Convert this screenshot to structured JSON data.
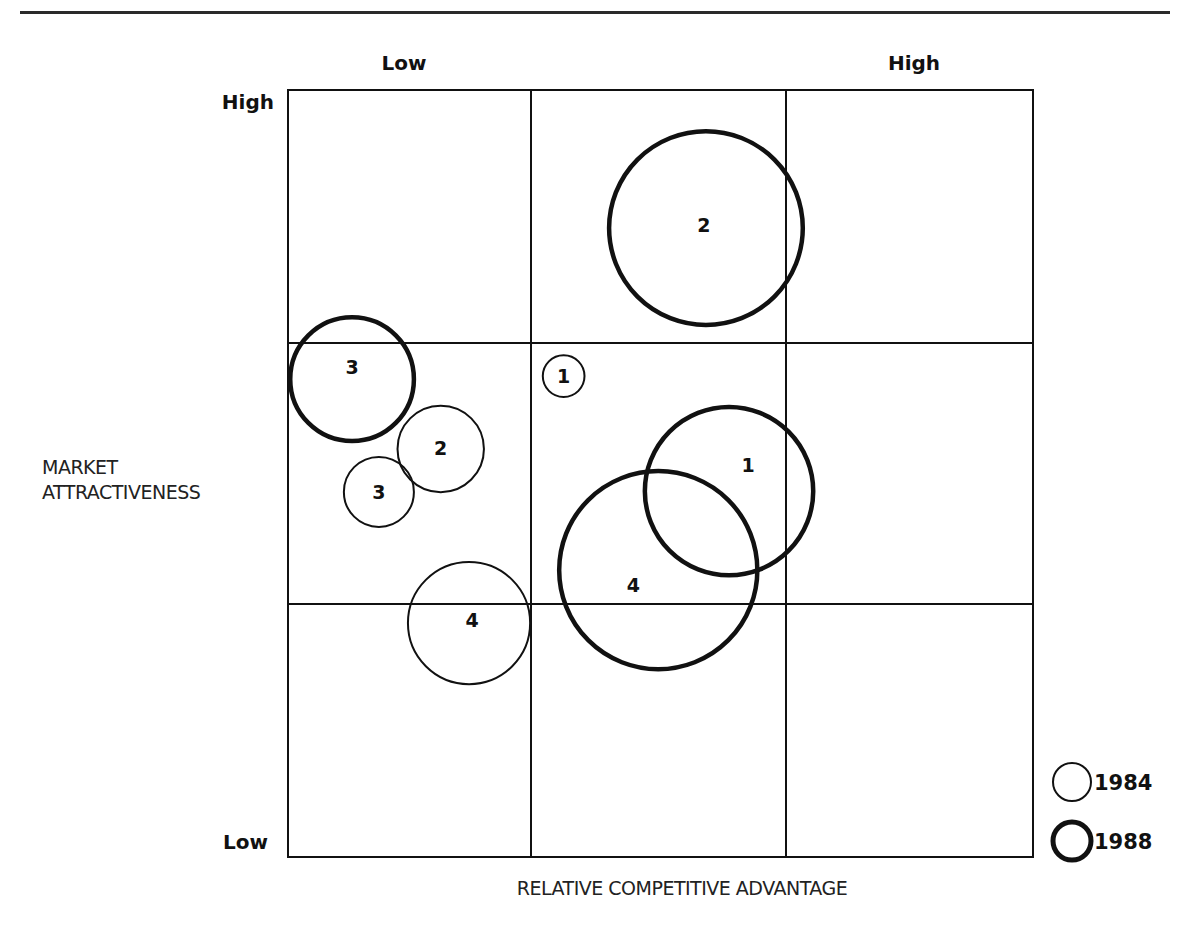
{
  "chart_data": {
    "type": "scatter",
    "subtype": "bubble-matrix",
    "title": "",
    "xlabel": "RELATIVE COMPETITIVE ADVANTAGE",
    "ylabel_lines": [
      "MARKET",
      "ATTRACTIVENESS"
    ],
    "x_ticks": {
      "low": "Low",
      "high": "High"
    },
    "y_ticks": {
      "high": "High",
      "low": "Low"
    },
    "xlim": [
      0,
      1
    ],
    "ylim": [
      0,
      1
    ],
    "grid": "3x3",
    "legend_position": "bottom-right",
    "series": [
      {
        "name": "1984",
        "style": "thin",
        "points": [
          {
            "label": "1",
            "x": 0.37,
            "y": 0.627,
            "size": 0.028
          },
          {
            "label": "2",
            "x": 0.205,
            "y": 0.532,
            "size": 0.058
          },
          {
            "label": "3",
            "x": 0.122,
            "y": 0.476,
            "size": 0.047
          },
          {
            "label": "4",
            "x": 0.243,
            "y": 0.305,
            "size": 0.082
          }
        ]
      },
      {
        "name": "1988",
        "style": "thick",
        "points": [
          {
            "label": "1",
            "x": 0.592,
            "y": 0.477,
            "size": 0.113
          },
          {
            "label": "2",
            "x": 0.561,
            "y": 0.82,
            "size": 0.13
          },
          {
            "label": "3",
            "x": 0.086,
            "y": 0.623,
            "size": 0.083
          },
          {
            "label": "4",
            "x": 0.497,
            "y": 0.374,
            "size": 0.133
          }
        ]
      }
    ],
    "legend": [
      {
        "label": "1984",
        "style": "thin"
      },
      {
        "label": "1988",
        "style": "thick"
      }
    ]
  }
}
